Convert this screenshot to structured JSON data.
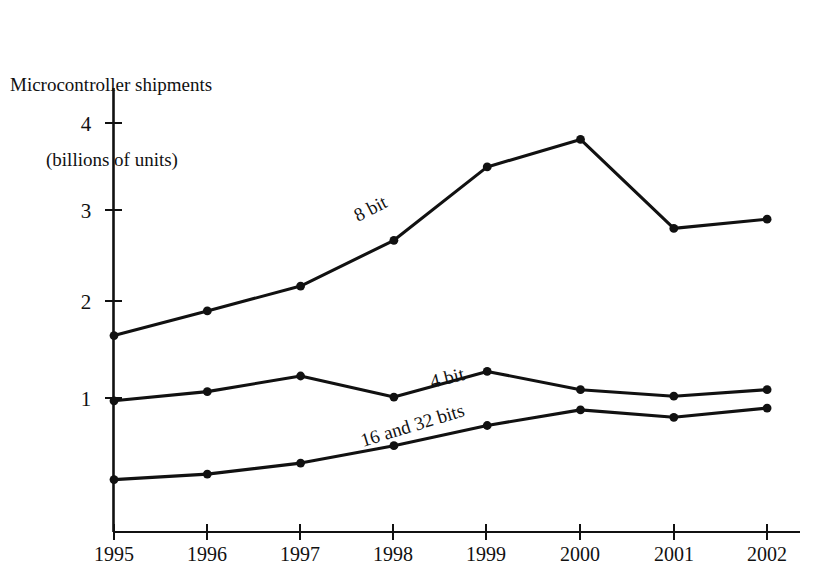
{
  "chart_data": {
    "type": "line",
    "title": "Microcontroller shipments (billions of units)",
    "title_line1": "Microcontroller shipments",
    "title_line2": "(billions of units)",
    "xlabel": "",
    "ylabel": "Microcontroller shipments (billions of units)",
    "categories": [
      "1995",
      "1996",
      "1997",
      "1998",
      "1999",
      "2000",
      "2001",
      "2002"
    ],
    "x": [
      1995,
      1996,
      1997,
      1998,
      1999,
      2000,
      2001,
      2002
    ],
    "xlim": [
      1995,
      2002
    ],
    "ylim": [
      0,
      4.35
    ],
    "yticks": [
      1,
      2,
      3,
      4
    ],
    "ytick_labels": [
      "1",
      "2",
      "3",
      "4"
    ],
    "xtick_labels": [
      "1995",
      "1996",
      "1997",
      "1998",
      "1999",
      "2000",
      "2001",
      "2002"
    ],
    "grid": false,
    "legend": "inline-labels",
    "line_color": "#111111",
    "marker": "filled-circle",
    "series": [
      {
        "name": "8 bit",
        "label": "8 bit",
        "values": [
          1.68,
          1.95,
          2.22,
          2.72,
          3.52,
          3.82,
          2.85,
          2.95
        ]
      },
      {
        "name": "4 bit",
        "label": "4 bit",
        "values": [
          0.97,
          1.07,
          1.24,
          1.01,
          1.29,
          1.09,
          1.02,
          1.09
        ]
      },
      {
        "name": "16 and 32 bits",
        "label": "16 and 32 bits",
        "values": [
          0.11,
          0.17,
          0.29,
          0.48,
          0.7,
          0.87,
          0.79,
          0.89
        ]
      }
    ],
    "annotations": [
      {
        "text": "8 bit",
        "series": "8 bit",
        "x": 1997.7,
        "rotation": -27
      },
      {
        "text": "4 bit",
        "series": "4 bit",
        "x": 1998.9,
        "rotation": -15
      },
      {
        "text": "16 and 32 bits",
        "series": "16 and 32 bits",
        "x": 1998.0,
        "rotation": -17
      }
    ]
  }
}
